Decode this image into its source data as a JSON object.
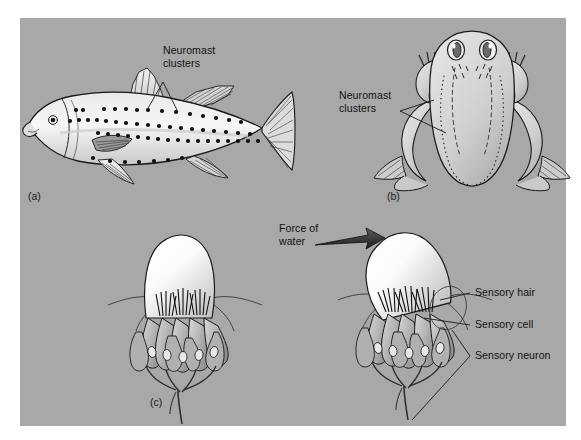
{
  "figure": {
    "background_color": "#ffffff",
    "panel_color": "#a8a8a8",
    "ink_color": "#1a1a1a",
    "width": 581,
    "height": 440,
    "topic": "Lateral line system / neuromast receptors"
  },
  "panels": [
    {
      "id": "a",
      "label": "(a)",
      "subject": "fish-lateral-line"
    },
    {
      "id": "b",
      "label": "(b)",
      "subject": "frog-lateral-line"
    },
    {
      "id": "c",
      "label": "(c)",
      "subject": "neuromast-detail"
    }
  ],
  "annotations": {
    "fish_neuromast": "Neuromast\nclusters",
    "frog_neuromast": "Neuromast\nclusters",
    "force_of_water": "Force of\nwater",
    "sensory_hair": "Sensory hair",
    "sensory_cell": "Sensory cell",
    "sensory_neuron": "Sensory neuron"
  },
  "fish": {
    "neuromast_rows": [
      {
        "name": "dorsal-row",
        "dots": 14
      },
      {
        "name": "upper-lateral-row",
        "dots": 18
      },
      {
        "name": "main-lateral-line-row",
        "dots": 22
      },
      {
        "name": "ventral-row",
        "dots": 7
      }
    ],
    "fins": [
      "dorsal-fin-anterior",
      "dorsal-fin-posterior",
      "pectoral-fin",
      "pelvic-fin",
      "anal-fin",
      "caudal-fin"
    ]
  },
  "frog": {
    "neuromast_line_style": "dotted-and-dashed",
    "features": [
      "two-eyes",
      "forelimbs",
      "hindlimbs",
      "webbed-feet"
    ]
  },
  "neuromast": {
    "left_state": "at rest",
    "right_state": "deflected by water current",
    "parts": [
      "cupula",
      "sensory hair",
      "sensory cell",
      "sensory neuron"
    ],
    "hair_bundles": 3,
    "sensory_cells": 7
  }
}
